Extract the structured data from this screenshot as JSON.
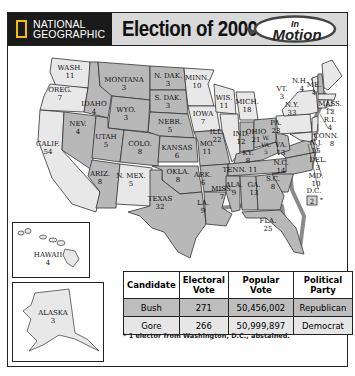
{
  "header": {
    "publisher_line1": "NATIONAL",
    "publisher_line2": "GEOGRAPHIC",
    "title": "Election of 2000",
    "badge_line1": "In",
    "badge_line2": "Motion"
  },
  "colors": {
    "republican_state": "#b8b8b8",
    "democrat_state": "#e8e8e8",
    "border": "#333333",
    "water_shadow": "#8a8a8a",
    "header_bg": "#d9d9d9",
    "publisher_bg": "#1a1a1a",
    "publisher_accent": "#f0c000"
  },
  "states": [
    {
      "abbr": "WASH.",
      "votes": "11",
      "party": "Democrat"
    },
    {
      "abbr": "OREG.",
      "votes": "7",
      "party": "Democrat"
    },
    {
      "abbr": "CALIF.",
      "votes": "54",
      "party": "Democrat"
    },
    {
      "abbr": "NEV.",
      "votes": "4",
      "party": "Republican"
    },
    {
      "abbr": "IDAHO",
      "votes": "4",
      "party": "Republican"
    },
    {
      "abbr": "MONTANA",
      "votes": "3",
      "party": "Republican"
    },
    {
      "abbr": "WYO.",
      "votes": "3",
      "party": "Republican"
    },
    {
      "abbr": "UTAH",
      "votes": "5",
      "party": "Republican"
    },
    {
      "abbr": "ARIZ.",
      "votes": "8",
      "party": "Republican"
    },
    {
      "abbr": "COLO.",
      "votes": "8",
      "party": "Republican"
    },
    {
      "abbr": "N. MEX.",
      "votes": "5",
      "party": "Democrat"
    },
    {
      "abbr": "N. DAK.",
      "votes": "3",
      "party": "Republican"
    },
    {
      "abbr": "S. DAK.",
      "votes": "3",
      "party": "Republican"
    },
    {
      "abbr": "NEBR.",
      "votes": "5",
      "party": "Republican"
    },
    {
      "abbr": "KANSAS",
      "votes": "6",
      "party": "Republican"
    },
    {
      "abbr": "OKLA.",
      "votes": "8",
      "party": "Republican"
    },
    {
      "abbr": "TEXAS",
      "votes": "32",
      "party": "Republican"
    },
    {
      "abbr": "MINN.",
      "votes": "10",
      "party": "Democrat"
    },
    {
      "abbr": "IOWA",
      "votes": "7",
      "party": "Democrat"
    },
    {
      "abbr": "MO.",
      "votes": "11",
      "party": "Republican"
    },
    {
      "abbr": "ARK.",
      "votes": "6",
      "party": "Republican"
    },
    {
      "abbr": "LA.",
      "votes": "9",
      "party": "Republican"
    },
    {
      "abbr": "WIS.",
      "votes": "11",
      "party": "Democrat"
    },
    {
      "abbr": "ILL.",
      "votes": "22",
      "party": "Democrat"
    },
    {
      "abbr": "MICH.",
      "votes": "18",
      "party": "Democrat"
    },
    {
      "abbr": "IND.",
      "votes": "12",
      "party": "Republican"
    },
    {
      "abbr": "OHIO",
      "votes": "21",
      "party": "Republican"
    },
    {
      "abbr": "KY.",
      "votes": "8",
      "party": "Republican"
    },
    {
      "abbr": "TENN.",
      "votes": "11",
      "party": "Republican"
    },
    {
      "abbr": "MISS.",
      "votes": "7",
      "party": "Republican"
    },
    {
      "abbr": "ALA.",
      "votes": "9",
      "party": "Republican"
    },
    {
      "abbr": "GA.",
      "votes": "13",
      "party": "Republican"
    },
    {
      "abbr": "FLA.",
      "votes": "25",
      "party": "Republican"
    },
    {
      "abbr": "S.C.",
      "votes": "8",
      "party": "Republican"
    },
    {
      "abbr": "N.C.",
      "votes": "14",
      "party": "Republican"
    },
    {
      "abbr": "VA.",
      "votes": "13",
      "party": "Republican"
    },
    {
      "abbr": "W. VA.",
      "votes": "5",
      "party": "Republican"
    },
    {
      "abbr": "PA.",
      "votes": "23",
      "party": "Democrat"
    },
    {
      "abbr": "N.Y.",
      "votes": "33",
      "party": "Democrat"
    },
    {
      "abbr": "VT.",
      "votes": "3",
      "party": "Democrat"
    },
    {
      "abbr": "N.H.",
      "votes": "4",
      "party": "Republican"
    },
    {
      "abbr": "ME.",
      "votes": "4",
      "party": "Democrat"
    },
    {
      "abbr": "MASS.",
      "votes": "12",
      "party": "Democrat"
    },
    {
      "abbr": "R.I.",
      "votes": "4",
      "party": "Democrat"
    },
    {
      "abbr": "CONN.",
      "votes": "8",
      "party": "Democrat"
    },
    {
      "abbr": "N.J.",
      "votes": "15",
      "party": "Democrat"
    },
    {
      "abbr": "DEL.",
      "votes": "3",
      "party": "Democrat"
    },
    {
      "abbr": "MD.",
      "votes": "10",
      "party": "Democrat"
    },
    {
      "abbr": "D.C.",
      "votes": "2*",
      "party": "Democrat"
    },
    {
      "abbr": "HAWAII",
      "votes": "4",
      "party": "Democrat"
    },
    {
      "abbr": "ALASKA",
      "votes": "3",
      "party": "Republican"
    }
  ],
  "labels": {
    "wash": "WASH.",
    "wash_v": "11",
    "oreg": "OREG.",
    "oreg_v": "7",
    "calif": "CALIF.",
    "calif_v": "54",
    "nev": "NEV.",
    "nev_v": "4",
    "idaho": "IDAHO",
    "idaho_v": "4",
    "mont": "MONTANA",
    "mont_v": "3",
    "wyo": "WYO.",
    "wyo_v": "3",
    "utah": "UTAH",
    "utah_v": "5",
    "ariz": "ARIZ.",
    "ariz_v": "8",
    "colo": "COLO.",
    "colo_v": "8",
    "nmex": "N. MEX.",
    "nmex_v": "5",
    "ndak": "N. DAK.",
    "ndak_v": "3",
    "sdak": "S. DAK.",
    "sdak_v": "3",
    "nebr": "NEBR.",
    "nebr_v": "5",
    "kans": "KANSAS",
    "kans_v": "6",
    "okla": "OKLA.",
    "okla_v": "8",
    "tex": "TEXAS",
    "tex_v": "32",
    "minn": "MINN.",
    "minn_v": "10",
    "iowa": "IOWA",
    "iowa_v": "7",
    "mo": "MO.",
    "mo_v": "11",
    "ark": "ARK.",
    "ark_v": "6",
    "la": "LA.",
    "la_v": "9",
    "wis": "WIS.",
    "wis_v": "11",
    "ill": "ILL.",
    "ill_v": "22",
    "mich": "MICH.",
    "mich_v": "18",
    "ind": "IND.",
    "ind_v": "12",
    "ohio": "OHIO",
    "ohio_v": "21",
    "ky": "KY.",
    "ky_v": "8",
    "tenn": "TENN. 11",
    "miss": "MISS.",
    "miss_v": "7",
    "ala": "ALA.",
    "ala_v": "9",
    "ga": "GA.",
    "ga_v": "13",
    "fla": "FLA.",
    "fla_v": "25",
    "sc": "S.C.",
    "sc_v": "8",
    "nc": "N.C.",
    "nc_v": "14",
    "va": "VA.",
    "va_v": "13",
    "wva": "W.",
    "wva2": "VA.",
    "wva_v": "5",
    "pa": "PA.",
    "pa_v": "23",
    "ny": "N.Y.",
    "ny_v": "33",
    "vt": "VT.",
    "vt_v": "3",
    "nh": "N.H.",
    "nh_v": "4",
    "me": "ME.",
    "me_v": "4",
    "mass": "MASS.",
    "mass_v": "12",
    "ri": "R.I.",
    "ri_v": "4",
    "conn": "CONN.",
    "conn_v": "8",
    "nj": "N.J.",
    "nj_v": "15",
    "del": "DEL.",
    "del_v": "3",
    "md": "MD.",
    "md_v": "10",
    "dc": "D.C.",
    "dc_v": "2",
    "dc_mark": "*",
    "hawaii": "HAWAII",
    "hawaii_v": "4",
    "alaska": "ALASKA",
    "alaska_v": "3"
  },
  "table": {
    "headers": [
      "Candidate",
      "Electoral Vote",
      "Popular Vote",
      "Political Party"
    ],
    "h0": "Candidate",
    "h1a": "Electoral",
    "h1b": "Vote",
    "h2a": "Popular",
    "h2b": "Vote",
    "h3a": "Political",
    "h3b": "Party",
    "rows": [
      {
        "candidate": "Bush",
        "electoral": "271",
        "popular": "50,456,002",
        "party": "Republican"
      },
      {
        "candidate": "Gore",
        "electoral": "266",
        "popular": "50,999,897",
        "party": "Democrat"
      }
    ]
  },
  "footnote": "* 1 elector from Washington, D.C., abstained."
}
